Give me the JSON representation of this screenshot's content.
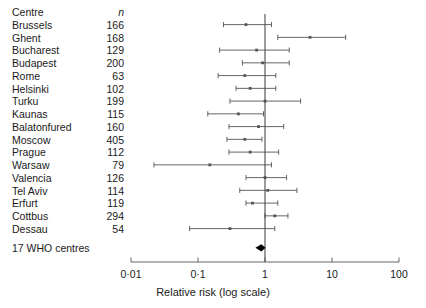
{
  "table": {
    "header": {
      "centre": "Centre",
      "n": "n"
    },
    "rows": [
      {
        "centre": "Brussels",
        "n": "166"
      },
      {
        "centre": "Ghent",
        "n": "168"
      },
      {
        "centre": "Bucharest",
        "n": "129"
      },
      {
        "centre": "Budapest",
        "n": "200"
      },
      {
        "centre": "Rome",
        "n": "63"
      },
      {
        "centre": "Helsinki",
        "n": "102"
      },
      {
        "centre": "Turku",
        "n": "199"
      },
      {
        "centre": "Kaunas",
        "n": "115"
      },
      {
        "centre": "Balatonfured",
        "n": "160"
      },
      {
        "centre": "Moscow",
        "n": "405"
      },
      {
        "centre": "Prague",
        "n": "112"
      },
      {
        "centre": "Warsaw",
        "n": "79"
      },
      {
        "centre": "Valencia",
        "n": "126"
      },
      {
        "centre": "Tel Aviv",
        "n": "114"
      },
      {
        "centre": "Erfurt",
        "n": "119"
      },
      {
        "centre": "Cottbus",
        "n": "294"
      },
      {
        "centre": "Dessau",
        "n": "54"
      }
    ],
    "summary_label": "17 WHO centres"
  },
  "axis": {
    "title": "Relative risk (log scale)",
    "ticks": [
      {
        "label": "0·01",
        "value": 0.01
      },
      {
        "label": "0·1",
        "value": 0.1
      },
      {
        "label": "1",
        "value": 1
      },
      {
        "label": "10",
        "value": 10
      },
      {
        "label": "100",
        "value": 100
      }
    ],
    "reference_value": 1
  },
  "chart_data": {
    "type": "forest",
    "title": "",
    "xlabel": "Relative risk (log scale)",
    "ylabel": "",
    "xscale": "log",
    "xlim": [
      0.01,
      100
    ],
    "grid": false,
    "reference_line": 1,
    "categories": [
      "Brussels",
      "Ghent",
      "Bucharest",
      "Budapest",
      "Rome",
      "Helsinki",
      "Turku",
      "Kaunas",
      "Balatonfured",
      "Moscow",
      "Prague",
      "Warsaw",
      "Valencia",
      "Tel Aviv",
      "Erfurt",
      "Cottbus",
      "Dessau"
    ],
    "counts": [
      166,
      168,
      129,
      200,
      63,
      102,
      199,
      115,
      160,
      405,
      112,
      79,
      126,
      114,
      119,
      294,
      54
    ],
    "points": [
      {
        "centre": "Brussels",
        "n": 166,
        "rr": 0.52,
        "lo": 0.24,
        "hi": 1.25
      },
      {
        "centre": "Ghent",
        "n": 168,
        "rr": 4.7,
        "lo": 1.55,
        "hi": 16.0
      },
      {
        "centre": "Bucharest",
        "n": 129,
        "rr": 0.75,
        "lo": 0.21,
        "hi": 2.3
      },
      {
        "centre": "Budapest",
        "n": 200,
        "rr": 0.92,
        "lo": 0.46,
        "hi": 2.3
      },
      {
        "centre": "Rome",
        "n": 63,
        "rr": 0.5,
        "lo": 0.2,
        "hi": 1.45
      },
      {
        "centre": "Helsinki",
        "n": 102,
        "rr": 0.6,
        "lo": 0.37,
        "hi": 1.45
      },
      {
        "centre": "Turku",
        "n": 199,
        "rr": 1.0,
        "lo": 0.3,
        "hi": 3.4
      },
      {
        "centre": "Kaunas",
        "n": 115,
        "rr": 0.4,
        "lo": 0.14,
        "hi": 0.95
      },
      {
        "centre": "Balatonfured",
        "n": 160,
        "rr": 0.8,
        "lo": 0.29,
        "hi": 1.9
      },
      {
        "centre": "Moscow",
        "n": 405,
        "rr": 0.5,
        "lo": 0.27,
        "hi": 0.9
      },
      {
        "centre": "Prague",
        "n": 112,
        "rr": 0.6,
        "lo": 0.29,
        "hi": 1.6
      },
      {
        "centre": "Warsaw",
        "n": 79,
        "rr": 0.15,
        "lo": 0.022,
        "hi": 1.25
      },
      {
        "centre": "Valencia",
        "n": 126,
        "rr": 1.0,
        "lo": 0.52,
        "hi": 2.1
      },
      {
        "centre": "Tel Aviv",
        "n": 114,
        "rr": 1.1,
        "lo": 0.42,
        "hi": 3.0
      },
      {
        "centre": "Erfurt",
        "n": 119,
        "rr": 0.65,
        "lo": 0.52,
        "hi": 1.55
      },
      {
        "centre": "Cottbus",
        "n": 294,
        "rr": 1.4,
        "lo": 1.0,
        "hi": 2.2
      },
      {
        "centre": "Dessau",
        "n": 54,
        "rr": 0.3,
        "lo": 0.075,
        "hi": 1.4
      }
    ],
    "summary": {
      "label": "17 WHO centres",
      "rr": 0.88,
      "lo": 0.72,
      "hi": 1.02
    }
  },
  "colors": {
    "line": "#555555",
    "reference": "#4a4a4a",
    "axis": "#555555",
    "summary": "#000000",
    "text": "#1a1a1a"
  }
}
